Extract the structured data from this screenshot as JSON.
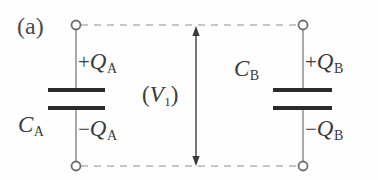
{
  "figure": {
    "panel_label": "(a)",
    "background_color": "#fefefe",
    "ink_color": "#3a3a3a",
    "wire_color": "#9a9a9a",
    "plate_color": "#2a2a2a",
    "dash_color": "#b0b0b0",
    "width": 378,
    "height": 180
  },
  "labels": {
    "capacitor_a_name": "C",
    "capacitor_a_sub": "A",
    "capacitor_b_name": "C",
    "capacitor_b_sub": "B",
    "charge_a_plus_sign": "+",
    "charge_a_plus_sym": "Q",
    "charge_a_plus_sub": "A",
    "charge_a_minus_sign": "−",
    "charge_a_minus_sym": "Q",
    "charge_a_minus_sub": "A",
    "charge_b_plus_sign": "+",
    "charge_b_plus_sym": "Q",
    "charge_b_plus_sub": "B",
    "charge_b_minus_sign": "−",
    "charge_b_minus_sym": "Q",
    "charge_b_minus_sub": "B",
    "voltage_open_paren": "(",
    "voltage_sym": "V",
    "voltage_sub": "1",
    "voltage_close_paren": ")"
  },
  "geometry": {
    "node_top_left": [
      76,
      25
    ],
    "node_bottom_left": [
      76,
      166
    ],
    "node_top_right": [
      303,
      25
    ],
    "node_bottom_right": [
      303,
      166
    ],
    "node_radius": 4.5,
    "plate_left_x1": 48,
    "plate_left_x2": 105,
    "plate_right_x1": 273,
    "plate_right_x2": 332,
    "plate_upper_y": 90,
    "plate_lower_y": 108,
    "arrow_x": 196,
    "arrow_y_top": 27,
    "arrow_y_bottom": 165
  }
}
